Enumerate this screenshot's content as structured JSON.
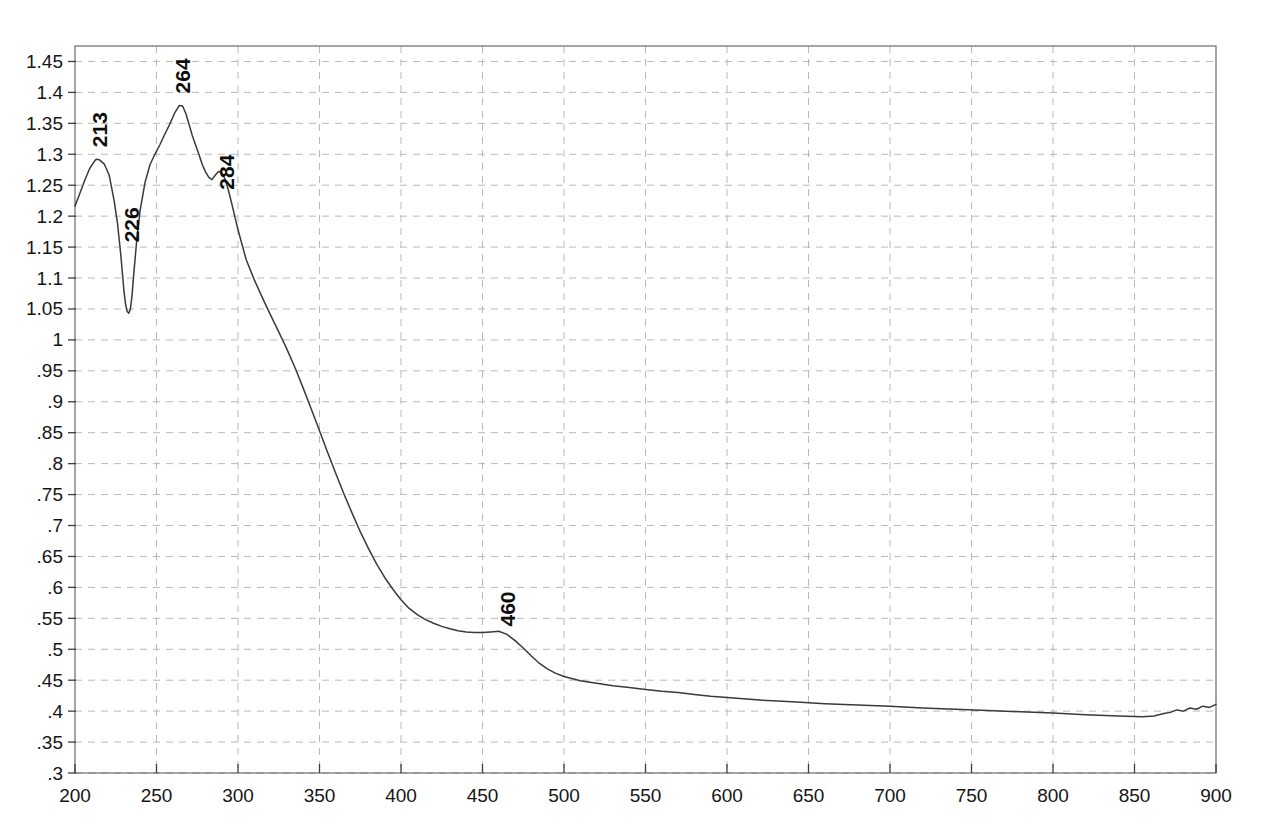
{
  "chart_data": {
    "type": "line",
    "title": "",
    "subtitle": "",
    "xlabel": "",
    "ylabel": "",
    "xlim": [
      200,
      900
    ],
    "ylim": [
      0.3,
      1.475
    ],
    "grid": true,
    "legend": false,
    "legend_position": "none",
    "x_ticks": [
      200,
      250,
      300,
      350,
      400,
      450,
      500,
      550,
      600,
      650,
      700,
      750,
      800,
      850,
      900
    ],
    "x_tick_labels": [
      "200",
      "250",
      "300",
      "350",
      "400",
      "450",
      "500",
      "550",
      "600",
      "650",
      "700",
      "750",
      "800",
      "850",
      "900"
    ],
    "y_ticks": [
      0.3,
      0.35,
      0.4,
      0.45,
      0.5,
      0.55,
      0.6,
      0.65,
      0.7,
      0.75,
      0.8,
      0.85,
      0.9,
      0.95,
      1.0,
      1.05,
      1.1,
      1.15,
      1.2,
      1.25,
      1.3,
      1.35,
      1.4,
      1.45
    ],
    "y_tick_labels": [
      ".3",
      ".35",
      ".4",
      ".45",
      ".5",
      ".55",
      ".6",
      ".65",
      ".7",
      ".75",
      ".8",
      ".85",
      ".9",
      ".95",
      "1",
      "1.05",
      "1.1",
      "1.15",
      "1.2",
      "1.25",
      "1.3",
      "1.35",
      "1.4",
      "1.45"
    ],
    "curve_color": "#3a3a3a",
    "grid_color": "#b9b9b9",
    "series": [
      {
        "name": "absorbance",
        "x": [
          200,
          203,
          206,
          209,
          212,
          213,
          215,
          218,
          221,
          224,
          226,
          228,
          230,
          231,
          232,
          233,
          234,
          235,
          236,
          238,
          240,
          243,
          246,
          249,
          252,
          255,
          258,
          261,
          264,
          266,
          268,
          270,
          272,
          274,
          276,
          278,
          280,
          282,
          284,
          286,
          288,
          290,
          292,
          294,
          296,
          298,
          300,
          305,
          310,
          315,
          320,
          325,
          330,
          335,
          340,
          345,
          350,
          355,
          360,
          365,
          370,
          375,
          380,
          385,
          390,
          395,
          400,
          405,
          410,
          415,
          420,
          425,
          430,
          435,
          440,
          445,
          450,
          455,
          460,
          465,
          470,
          475,
          480,
          485,
          490,
          495,
          500,
          510,
          520,
          530,
          540,
          550,
          560,
          570,
          580,
          590,
          600,
          620,
          640,
          660,
          680,
          700,
          720,
          740,
          760,
          780,
          800,
          820,
          840,
          855,
          862,
          868,
          872,
          876,
          880,
          884,
          888,
          892,
          896,
          900
        ],
        "y": [
          1.216,
          1.237,
          1.258,
          1.277,
          1.289,
          1.292,
          1.291,
          1.284,
          1.266,
          1.225,
          1.19,
          1.14,
          1.08,
          1.058,
          1.046,
          1.043,
          1.05,
          1.072,
          1.105,
          1.165,
          1.21,
          1.255,
          1.283,
          1.3,
          1.315,
          1.332,
          1.348,
          1.366,
          1.379,
          1.378,
          1.366,
          1.348,
          1.33,
          1.315,
          1.3,
          1.284,
          1.272,
          1.263,
          1.259,
          1.266,
          1.272,
          1.271,
          1.26,
          1.243,
          1.222,
          1.2,
          1.178,
          1.13,
          1.097,
          1.068,
          1.04,
          1.013,
          0.985,
          0.955,
          0.922,
          0.888,
          0.853,
          0.818,
          0.784,
          0.751,
          0.72,
          0.69,
          0.663,
          0.638,
          0.616,
          0.597,
          0.58,
          0.566,
          0.556,
          0.548,
          0.542,
          0.537,
          0.533,
          0.53,
          0.528,
          0.527,
          0.527,
          0.528,
          0.529,
          0.524,
          0.514,
          0.502,
          0.489,
          0.477,
          0.468,
          0.461,
          0.456,
          0.449,
          0.445,
          0.441,
          0.438,
          0.435,
          0.432,
          0.43,
          0.427,
          0.424,
          0.422,
          0.418,
          0.415,
          0.412,
          0.41,
          0.408,
          0.405,
          0.403,
          0.401,
          0.399,
          0.397,
          0.394,
          0.392,
          0.391,
          0.392,
          0.396,
          0.398,
          0.402,
          0.4,
          0.405,
          0.403,
          0.408,
          0.406,
          0.411
        ]
      }
    ],
    "annotations": [
      {
        "label": "213",
        "x": 213,
        "y": 1.292,
        "rotation": -90,
        "kind": "peak"
      },
      {
        "label": "226",
        "x": 226,
        "y": 1.19,
        "rotation": -90,
        "kind": "peak"
      },
      {
        "label": "264",
        "x": 264,
        "y": 1.379,
        "rotation": -90,
        "kind": "peak"
      },
      {
        "label": "284",
        "x": 284,
        "y": 1.259,
        "rotation": -90,
        "kind": "peak"
      },
      {
        "label": "460",
        "x": 460,
        "y": 0.527,
        "rotation": -90,
        "kind": "peak"
      }
    ]
  }
}
